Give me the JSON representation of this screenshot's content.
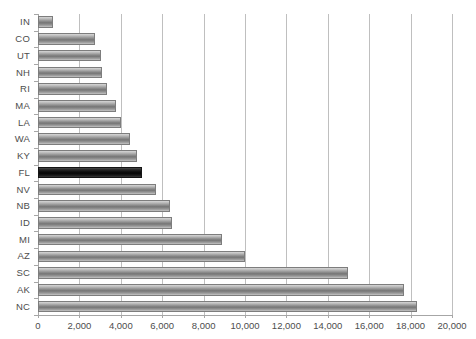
{
  "chart_data": {
    "type": "bar",
    "orientation": "horizontal",
    "title": "",
    "subtitle": "",
    "xlabel": "",
    "ylabel": "",
    "xlim": [
      0,
      20000
    ],
    "xtick_step": 2000,
    "grid": true,
    "legend": false,
    "categories": [
      "IN",
      "CO",
      "UT",
      "NH",
      "RI",
      "MA",
      "LA",
      "WA",
      "KY",
      "FL",
      "NV",
      "NB",
      "ID",
      "MI",
      "AZ",
      "SC",
      "AK",
      "NC"
    ],
    "values": [
      730,
      2750,
      3050,
      3100,
      3350,
      3770,
      4010,
      4450,
      4780,
      5030,
      5700,
      6380,
      6470,
      8900,
      10000,
      14980,
      17680,
      18330
    ],
    "highlight_category": "FL",
    "xtick_labels": [
      "0",
      "2,000",
      "4,000",
      "6,000",
      "8,000",
      "10,000",
      "12,000",
      "14,000",
      "16,000",
      "18,000",
      "20,000"
    ],
    "xtick_values": [
      0,
      2000,
      4000,
      6000,
      8000,
      10000,
      12000,
      14000,
      16000,
      18000,
      20000
    ],
    "colors": {
      "bar": "#8e8e8e",
      "bar_border": "#7d7d7d",
      "highlight_bar": "#101010",
      "highlight_border": "#151515",
      "grid": "#bfbfbf",
      "axis": "#a6a6a6",
      "text": "#4d4d4d",
      "background": "#ffffff"
    }
  }
}
